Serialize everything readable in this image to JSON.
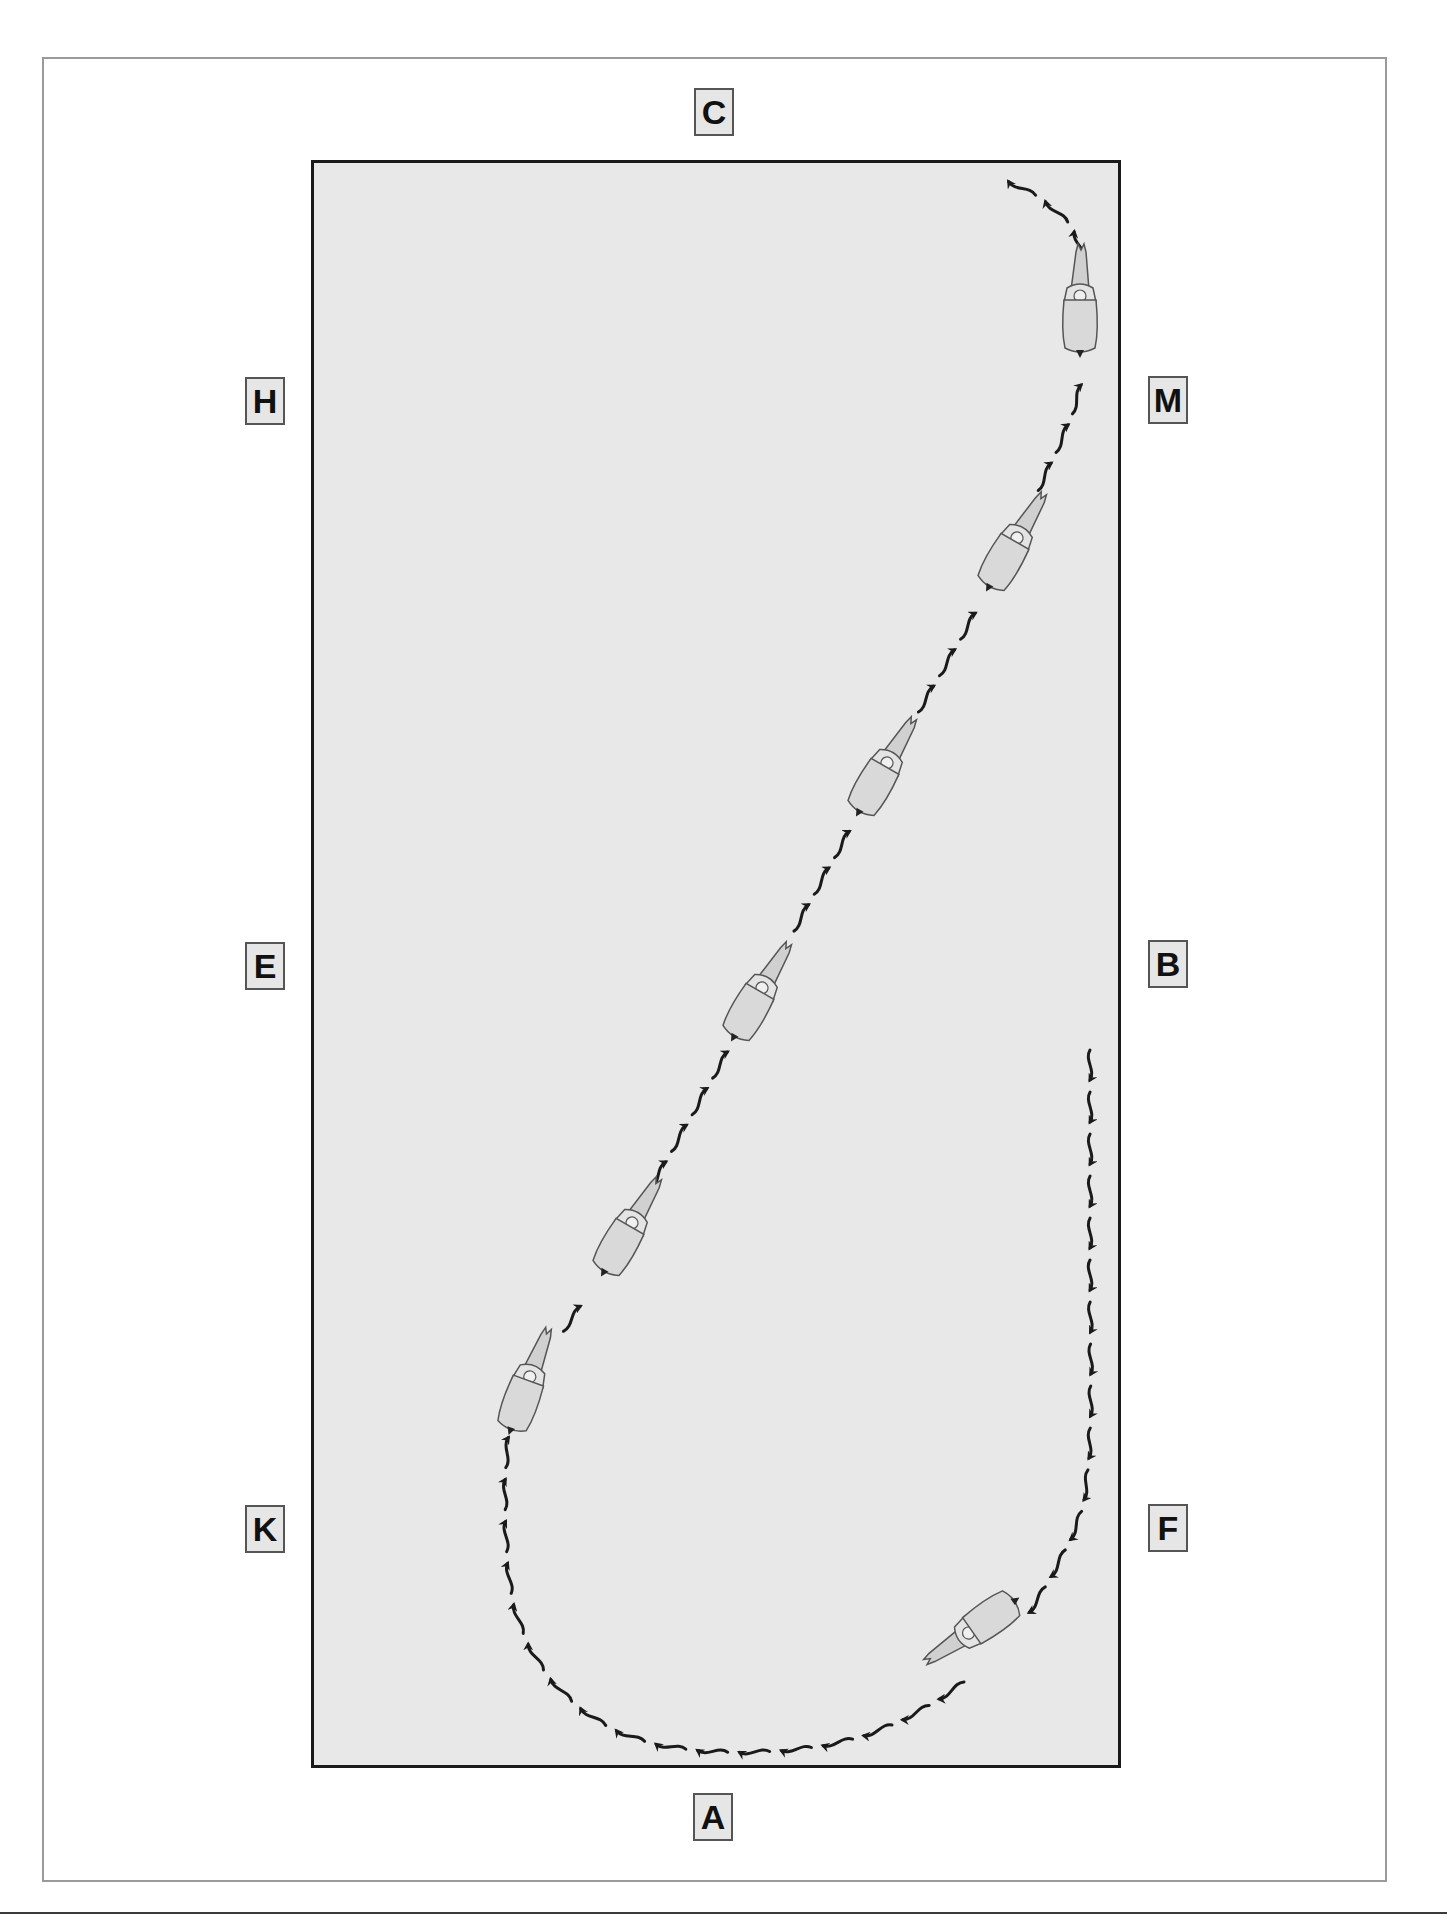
{
  "diagram": {
    "type": "dressage-arena-movement",
    "colors": {
      "arena_fill": "#e8e8e8",
      "arena_border": "#1a1a1a",
      "frame_border": "#9a9a9a",
      "marker_fill": "#e6e6e6",
      "marker_border": "#555555",
      "path_stroke": "#1a1a1a",
      "horse_fill": "#d9d9d9",
      "horse_stroke": "#555555"
    },
    "markers": [
      {
        "id": "C",
        "label": "C",
        "x": 694,
        "y": 88
      },
      {
        "id": "H",
        "label": "H",
        "x": 245,
        "y": 377
      },
      {
        "id": "M",
        "label": "M",
        "x": 1148,
        "y": 376
      },
      {
        "id": "E",
        "label": "E",
        "x": 245,
        "y": 942
      },
      {
        "id": "B",
        "label": "B",
        "x": 1148,
        "y": 940
      },
      {
        "id": "K",
        "label": "K",
        "x": 245,
        "y": 1505
      },
      {
        "id": "F",
        "label": "F",
        "x": 1148,
        "y": 1504
      },
      {
        "id": "A",
        "label": "A",
        "x": 693,
        "y": 1793
      }
    ],
    "path": {
      "description": "Down the right long side from B toward F, half-circle loop near A, then diagonal from K side toward M and on toward C",
      "segments": [
        {
          "name": "right-track-down",
          "from": [
            1090,
            1050
          ],
          "to": [
            1090,
            1480
          ]
        },
        {
          "name": "loop-near-A",
          "through": [
            [
              1060,
              1560
            ],
            [
              960,
              1680
            ],
            [
              760,
              1750
            ],
            [
              600,
              1720
            ],
            [
              520,
              1620
            ],
            [
              505,
              1420
            ]
          ]
        },
        {
          "name": "diagonal-K-to-M",
          "from": [
            505,
            1420
          ],
          "to": [
            1085,
            380
          ]
        },
        {
          "name": "curve-to-C",
          "through": [
            [
              1085,
              380
            ],
            [
              1080,
              270
            ],
            [
              1050,
              210
            ],
            [
              1005,
              180
            ]
          ]
        }
      ]
    },
    "horses": [
      {
        "x": 1080,
        "y": 310,
        "angle": 0
      },
      {
        "x": 1010,
        "y": 550,
        "angle": 30
      },
      {
        "x": 880,
        "y": 775,
        "angle": 30
      },
      {
        "x": 755,
        "y": 1000,
        "angle": 30
      },
      {
        "x": 625,
        "y": 1235,
        "angle": 30
      },
      {
        "x": 525,
        "y": 1390,
        "angle": 20
      },
      {
        "x": 980,
        "y": 1625,
        "angle": 235
      }
    ]
  }
}
